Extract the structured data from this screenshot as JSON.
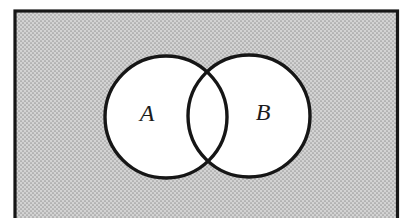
{
  "venn": {
    "set_labels": {
      "a": "A",
      "b": "B"
    },
    "shading": "outside-union-shaded",
    "colors": {
      "shade_base": "#d3d3d3",
      "shade_dot": "#9a9a9a",
      "outline": "#161616",
      "region_fill": "#ffffff",
      "label_ink": "#1c1c1c",
      "page": "#ffffff"
    }
  }
}
